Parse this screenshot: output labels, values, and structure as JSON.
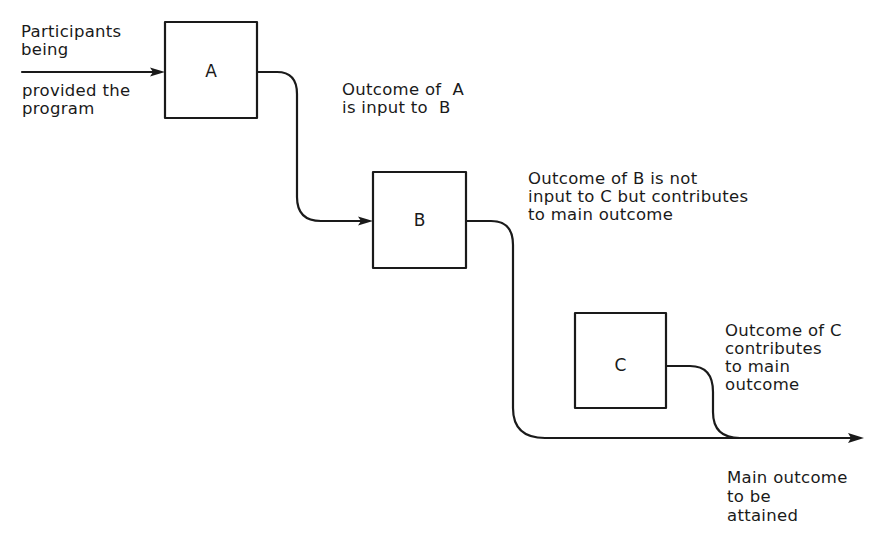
{
  "diagram": {
    "type": "program-component-flow",
    "boxes": [
      {
        "id": "A",
        "label": "A"
      },
      {
        "id": "B",
        "label": "B"
      },
      {
        "id": "C",
        "label": "C"
      }
    ],
    "annotations": {
      "input_top": "Participants\nbeing",
      "input_bottom": "provided the\nprogram",
      "a_to_b": "Outcome of  A\nis input to  B",
      "b_note": "Outcome of B is not\ninput to C but contributes\nto main outcome",
      "c_note": "Outcome of C\ncontributes\nto main\noutcome",
      "main_outcome": "Main outcome\nto be\nattained"
    },
    "edges": [
      {
        "from": "input",
        "to": "A",
        "arrow": true
      },
      {
        "from": "A",
        "to": "B",
        "arrow": true
      },
      {
        "from": "B",
        "to": "main-outcome",
        "arrow": false
      },
      {
        "from": "C",
        "to": "main-outcome",
        "arrow": false
      },
      {
        "from": "main-line",
        "to": "main-outcome",
        "arrow": true
      }
    ],
    "colors": {
      "stroke": "#1a1a1a",
      "background": "#ffffff"
    }
  }
}
